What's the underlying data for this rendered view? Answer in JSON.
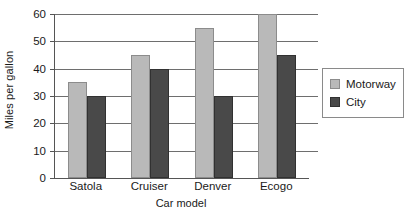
{
  "chart_data": {
    "type": "bar",
    "title": "",
    "xlabel": "Car model",
    "ylabel": "Miles per gallon",
    "categories": [
      "Satola",
      "Cruiser",
      "Denver",
      "Ecogo"
    ],
    "series": [
      {
        "name": "Motorway",
        "color": "#b9b9b9",
        "values": [
          35,
          45,
          55,
          60
        ]
      },
      {
        "name": "City",
        "color": "#494949",
        "values": [
          30,
          40,
          30,
          45
        ]
      }
    ],
    "ylim": [
      0,
      60
    ],
    "ytick_values": [
      0,
      10,
      20,
      30,
      40,
      50,
      60
    ],
    "ytick_labels": [
      "0",
      "10",
      "20",
      "30",
      "40",
      "50",
      "60"
    ],
    "grid": "horizontal",
    "legend_position": "right",
    "legend_boxed": true
  }
}
